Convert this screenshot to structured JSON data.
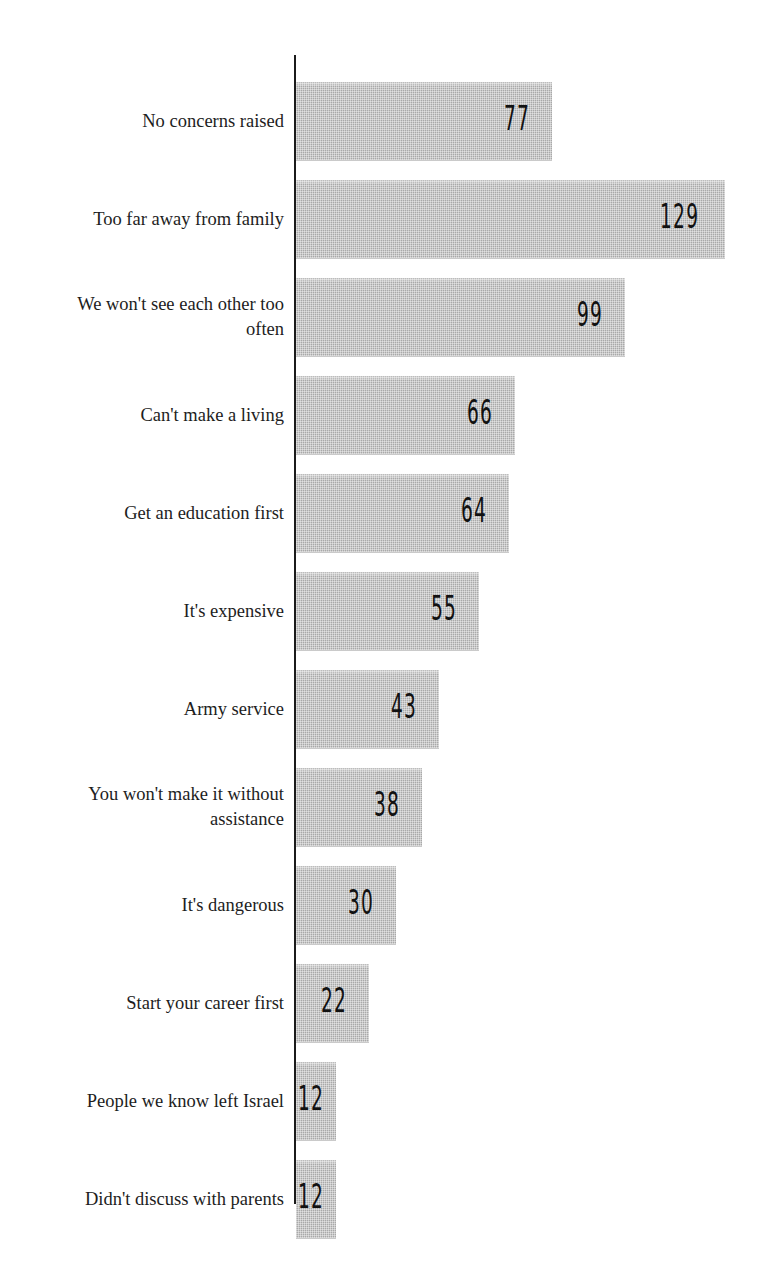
{
  "figure": {
    "title_cut": "",
    "axis_color": "#1b1b1b",
    "bar_color": "#a9a9a9",
    "value_label_color": "#111111",
    "background": "#ffffff"
  },
  "chart_data": {
    "type": "bar",
    "orientation": "horizontal",
    "title": "",
    "xlabel": "",
    "ylabel": "",
    "grid": false,
    "legend": "none",
    "xlim": [
      0,
      129
    ],
    "value_labels_position": "inside-end",
    "categories": [
      "No concerns raised",
      "Too far away from family",
      "We won't see each other too\noften",
      "Can't make a living",
      "Get an education first",
      "It's expensive",
      "Army service",
      "You won't make it without\nassistance",
      "It's dangerous",
      "Start your career first",
      "People we know left Israel",
      "Didn't discuss with parents"
    ],
    "values": [
      77,
      129,
      99,
      66,
      64,
      55,
      43,
      38,
      30,
      22,
      12,
      12
    ],
    "bars": [
      {
        "label": "No concerns raised",
        "value": 77,
        "value_text": "77"
      },
      {
        "label": "Too far away from family",
        "value": 129,
        "value_text": "129"
      },
      {
        "label": "We won't see each other too\noften",
        "value": 99,
        "value_text": "99"
      },
      {
        "label": "Can't make a living",
        "value": 66,
        "value_text": "66"
      },
      {
        "label": "Get an education first",
        "value": 64,
        "value_text": "64"
      },
      {
        "label": "It's expensive",
        "value": 55,
        "value_text": "55"
      },
      {
        "label": "Army service",
        "value": 43,
        "value_text": "43"
      },
      {
        "label": "You won't make it without\nassistance",
        "value": 38,
        "value_text": "38"
      },
      {
        "label": "It's dangerous",
        "value": 30,
        "value_text": "30"
      },
      {
        "label": "Start your career first",
        "value": 22,
        "value_text": "22"
      },
      {
        "label": "People we know left Israel",
        "value": 12,
        "value_text": "12"
      },
      {
        "label": "Didn't discuss with parents",
        "value": 12,
        "value_text": "12"
      }
    ]
  }
}
